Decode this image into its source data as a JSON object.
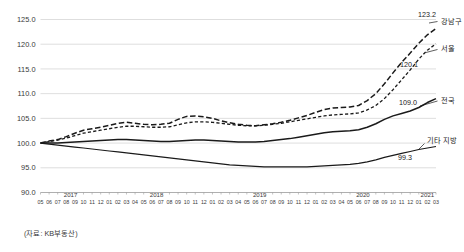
{
  "chart_data": {
    "type": "line",
    "title": "",
    "xlabel": "",
    "ylabel": "",
    "ylim": [
      90.0,
      125.0
    ],
    "grid": true,
    "legend_position": "right-inline-labels",
    "y_ticks": [
      "125.0",
      "120.0",
      "115.0",
      "110.0",
      "105.0",
      "100.0",
      "95.0",
      "90.0"
    ],
    "y_tick_values": [
      125.0,
      120.0,
      115.0,
      110.0,
      105.0,
      100.0,
      95.0,
      90.0
    ],
    "years": [
      {
        "label": "2017",
        "start_index": 0,
        "count": 8
      },
      {
        "label": "2018",
        "start_index": 8,
        "count": 12
      },
      {
        "label": "2019",
        "start_index": 20,
        "count": 12
      },
      {
        "label": "2020",
        "start_index": 32,
        "count": 12
      },
      {
        "label": "2021",
        "start_index": 44,
        "count": 3
      }
    ],
    "months": [
      "05",
      "06",
      "07",
      "08",
      "09",
      "10",
      "11",
      "12",
      "01",
      "02",
      "03",
      "04",
      "05",
      "06",
      "07",
      "08",
      "09",
      "10",
      "11",
      "12",
      "01",
      "02",
      "03",
      "04",
      "05",
      "06",
      "07",
      "08",
      "09",
      "10",
      "11",
      "12",
      "01",
      "02",
      "03",
      "04",
      "05",
      "06",
      "07",
      "08",
      "09",
      "10",
      "11",
      "12",
      "01",
      "02",
      "03"
    ],
    "x": [
      "2017-05",
      "2017-06",
      "2017-07",
      "2017-08",
      "2017-09",
      "2017-10",
      "2017-11",
      "2017-12",
      "2018-01",
      "2018-02",
      "2018-03",
      "2018-04",
      "2018-05",
      "2018-06",
      "2018-07",
      "2018-08",
      "2018-09",
      "2018-10",
      "2018-11",
      "2018-12",
      "2019-01",
      "2019-02",
      "2019-03",
      "2019-04",
      "2019-05",
      "2019-06",
      "2019-07",
      "2019-08",
      "2019-09",
      "2019-10",
      "2019-11",
      "2019-12",
      "2020-01",
      "2020-02",
      "2020-03",
      "2020-04",
      "2020-05",
      "2020-06",
      "2020-07",
      "2020-08",
      "2020-09",
      "2020-10",
      "2020-11",
      "2020-12",
      "2021-01",
      "2021-02",
      "2021-03"
    ],
    "series": [
      {
        "name": "강남구",
        "end_label": "강남구",
        "end_value": "123.2",
        "end_value_number": 123.2,
        "style": "dashed-long",
        "color": "#1a1a1a",
        "width": 1.5,
        "values": [
          100.0,
          100.4,
          100.7,
          101.3,
          102.0,
          102.6,
          102.9,
          103.2,
          103.6,
          104.0,
          104.2,
          104.0,
          103.8,
          103.7,
          103.8,
          104.0,
          104.8,
          105.4,
          105.5,
          105.3,
          105.0,
          104.5,
          104.1,
          103.8,
          103.6,
          103.5,
          103.7,
          103.9,
          104.2,
          104.6,
          105.1,
          105.6,
          106.2,
          106.8,
          107.1,
          107.2,
          107.3,
          107.6,
          108.6,
          110.0,
          112.0,
          114.2,
          116.3,
          118.2,
          120.2,
          121.9,
          123.2
        ]
      },
      {
        "name": "서울",
        "end_label": "서울",
        "end_value": "120.1",
        "end_value_number": 120.1,
        "style": "dashed-short",
        "color": "#1a1a1a",
        "width": 1.3,
        "values": [
          100.0,
          100.3,
          100.6,
          101.0,
          101.5,
          102.0,
          102.3,
          102.6,
          102.9,
          103.2,
          103.4,
          103.4,
          103.3,
          103.2,
          103.2,
          103.3,
          103.7,
          104.1,
          104.3,
          104.3,
          104.2,
          104.0,
          103.8,
          103.6,
          103.5,
          103.5,
          103.6,
          103.8,
          104.0,
          104.3,
          104.6,
          104.9,
          105.2,
          105.5,
          105.7,
          105.8,
          105.9,
          106.1,
          106.7,
          107.6,
          109.0,
          110.8,
          112.8,
          114.8,
          117.0,
          118.8,
          120.1
        ]
      },
      {
        "name": "전국",
        "end_label": "전국",
        "end_value": "109.0",
        "end_value_number": 109.0,
        "style": "solid",
        "color": "#1a1a1a",
        "width": 1.5,
        "values": [
          100.0,
          100.0,
          100.0,
          100.1,
          100.2,
          100.3,
          100.4,
          100.5,
          100.6,
          100.7,
          100.7,
          100.6,
          100.5,
          100.4,
          100.3,
          100.3,
          100.4,
          100.5,
          100.6,
          100.6,
          100.5,
          100.4,
          100.3,
          100.2,
          100.2,
          100.2,
          100.3,
          100.5,
          100.7,
          100.9,
          101.2,
          101.5,
          101.8,
          102.1,
          102.3,
          102.4,
          102.5,
          102.7,
          103.2,
          103.9,
          104.8,
          105.5,
          106.0,
          106.5,
          107.2,
          108.2,
          109.0
        ]
      },
      {
        "name": "기타 지방",
        "end_label": "기타 지방",
        "end_value": "99.3",
        "end_value_number": 99.3,
        "style": "solid",
        "color": "#1a1a1a",
        "width": 1.2,
        "values": [
          100.0,
          99.8,
          99.6,
          99.4,
          99.2,
          99.0,
          98.8,
          98.6,
          98.4,
          98.2,
          98.0,
          97.8,
          97.6,
          97.4,
          97.2,
          97.0,
          96.8,
          96.6,
          96.4,
          96.2,
          96.0,
          95.8,
          95.6,
          95.5,
          95.4,
          95.3,
          95.2,
          95.2,
          95.2,
          95.2,
          95.2,
          95.2,
          95.3,
          95.4,
          95.5,
          95.6,
          95.7,
          95.9,
          96.2,
          96.6,
          97.1,
          97.5,
          97.9,
          98.3,
          98.7,
          99.0,
          99.3
        ]
      }
    ]
  },
  "footer": {
    "source": "(자료: KB부동산)"
  }
}
